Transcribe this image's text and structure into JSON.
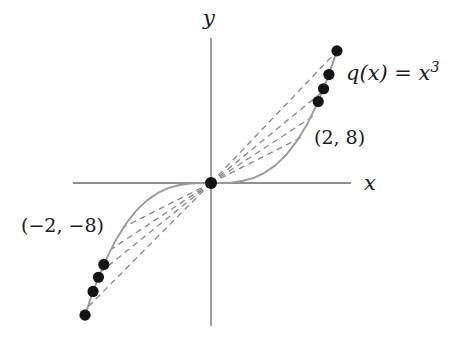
{
  "figure": {
    "title_visible": false,
    "background_color": "#ffffff",
    "axis_color": "#6b6b6b",
    "curve_color": "#9a9a9a",
    "secant_color": "#8a8a8a",
    "point_color": "#141414",
    "text_color": "#1a1a1a"
  },
  "labels": {
    "axis_x": "x",
    "axis_y": "y",
    "function": "q(x) = x",
    "function_exponent": "3",
    "point_positive": "(2, 8)",
    "point_negative": "(−2, −8)"
  },
  "chart_data": {
    "type": "line",
    "title": "",
    "xlabel": "x",
    "ylabel": "y",
    "subtitle": "",
    "grid": false,
    "legend_position": "none",
    "annotations": [
      {
        "text": "q(x) = x^3",
        "target": "curve",
        "x": 2.35,
        "y": 9.6
      },
      {
        "text": "(2, 8)",
        "target": "point",
        "x": 2.0,
        "y": 8.0
      },
      {
        "text": "(-2, -8)",
        "target": "point",
        "x": -2.0,
        "y": -8.0
      }
    ],
    "xlim": [
      -3.0,
      3.0
    ],
    "ylim": [
      -13.5,
      13.5
    ],
    "series": [
      {
        "name": "q(x) = x^3",
        "style": "solid",
        "color": "#9a9a9a",
        "x": [
          -2.35,
          -2.2,
          -2.0,
          -1.8,
          -1.6,
          -1.4,
          -1.2,
          -1.0,
          -0.8,
          -0.6,
          -0.4,
          -0.2,
          0.0,
          0.2,
          0.4,
          0.6,
          0.8,
          1.0,
          1.2,
          1.4,
          1.6,
          1.8,
          2.0,
          2.2,
          2.35
        ],
        "y": [
          -12.98,
          -10.65,
          -8.0,
          -5.83,
          -4.1,
          -2.74,
          -1.73,
          -1.0,
          -0.51,
          -0.22,
          -0.06,
          -0.01,
          0.0,
          0.01,
          0.06,
          0.22,
          0.51,
          1.0,
          1.73,
          2.74,
          4.1,
          5.83,
          8.0,
          10.65,
          12.98
        ]
      }
    ],
    "marked_points": [
      {
        "x": 2.35,
        "y": 12.98,
        "label": ""
      },
      {
        "x": 2.2,
        "y": 10.65,
        "label": ""
      },
      {
        "x": 2.1,
        "y": 9.26,
        "label": ""
      },
      {
        "x": 2.0,
        "y": 8.0,
        "label": "(2, 8)"
      },
      {
        "x": 0.0,
        "y": 0.0,
        "label": "origin"
      },
      {
        "x": -2.0,
        "y": -8.0,
        "label": "(-2, -8)"
      },
      {
        "x": -2.1,
        "y": -9.26,
        "label": ""
      },
      {
        "x": -2.2,
        "y": -10.65,
        "label": ""
      },
      {
        "x": -2.35,
        "y": -12.98,
        "label": ""
      }
    ],
    "secant_lines": [
      {
        "from": [
          0,
          0
        ],
        "to": [
          2.35,
          12.98
        ],
        "style": "dashed",
        "slope": 5.52
      },
      {
        "from": [
          0,
          0
        ],
        "to": [
          2.2,
          10.65
        ],
        "style": "dashed",
        "slope": 4.84
      },
      {
        "from": [
          0,
          0
        ],
        "to": [
          2.1,
          9.26
        ],
        "style": "dashed",
        "slope": 4.41
      },
      {
        "from": [
          0,
          0
        ],
        "to": [
          2.0,
          8.0
        ],
        "style": "dashed",
        "slope": 4.0
      },
      {
        "from": [
          0,
          0
        ],
        "to": [
          -2.0,
          -8.0
        ],
        "style": "dashed",
        "slope": 4.0
      },
      {
        "from": [
          0,
          0
        ],
        "to": [
          -2.1,
          -9.26
        ],
        "style": "dashed",
        "slope": 4.41
      },
      {
        "from": [
          0,
          0
        ],
        "to": [
          -2.2,
          -10.65
        ],
        "style": "dashed",
        "slope": 4.84
      },
      {
        "from": [
          0,
          0
        ],
        "to": [
          -2.35,
          -12.98
        ],
        "style": "dashed",
        "slope": 5.52
      }
    ]
  }
}
